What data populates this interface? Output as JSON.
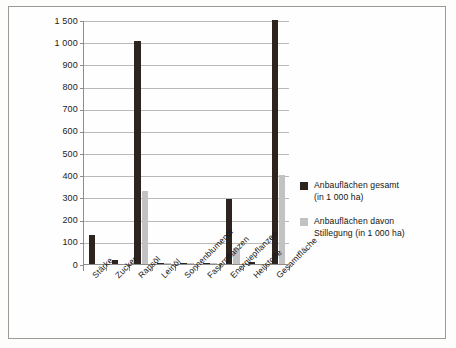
{
  "chart_data": {
    "type": "bar",
    "title": "",
    "subtitle": "",
    "xlabel": "",
    "ylabel": "",
    "grid": true,
    "legend_position": "right",
    "axis_note": "broken y-axis: ticks evenly spaced at 0,100,...,1000 then 1500",
    "categories": [
      "Stärke",
      "Zucker",
      "Rapsöl",
      "Leinöl",
      "Sonnenblumenöl",
      "Faserpflanzen",
      "Energiepflanzen",
      "Heilstoffe",
      "Gesamtfläche"
    ],
    "ytick_labels": [
      "0",
      "100",
      "200",
      "300",
      "400",
      "500",
      "600",
      "700",
      "800",
      "900",
      "1 000",
      "1 500"
    ],
    "ytick_values": [
      0,
      100,
      200,
      300,
      400,
      500,
      600,
      700,
      800,
      900,
      1000,
      1500
    ],
    "ylim": [
      0,
      1500
    ],
    "series": [
      {
        "name": "Anbauflächen gesamt (in 1 000 ha)",
        "color": "#2d2420",
        "values": [
          130,
          20,
          1020,
          3,
          4,
          2,
          295,
          8,
          1510
        ]
      },
      {
        "name": "Anbauflächen davon Stillegung (in 1 000 ha)",
        "color": "#c2c2c2",
        "values": [
          0,
          0,
          330,
          2,
          1,
          1,
          70,
          0,
          400
        ]
      }
    ]
  },
  "legend": {
    "items": [
      {
        "swatch": "s0",
        "line1": "Anbauflächen gesamt",
        "line2": "(in 1 000 ha)"
      },
      {
        "swatch": "s1",
        "line1": "Anbauflächen davon",
        "line2": "Stillegung (in 1 000 ha)"
      }
    ]
  }
}
